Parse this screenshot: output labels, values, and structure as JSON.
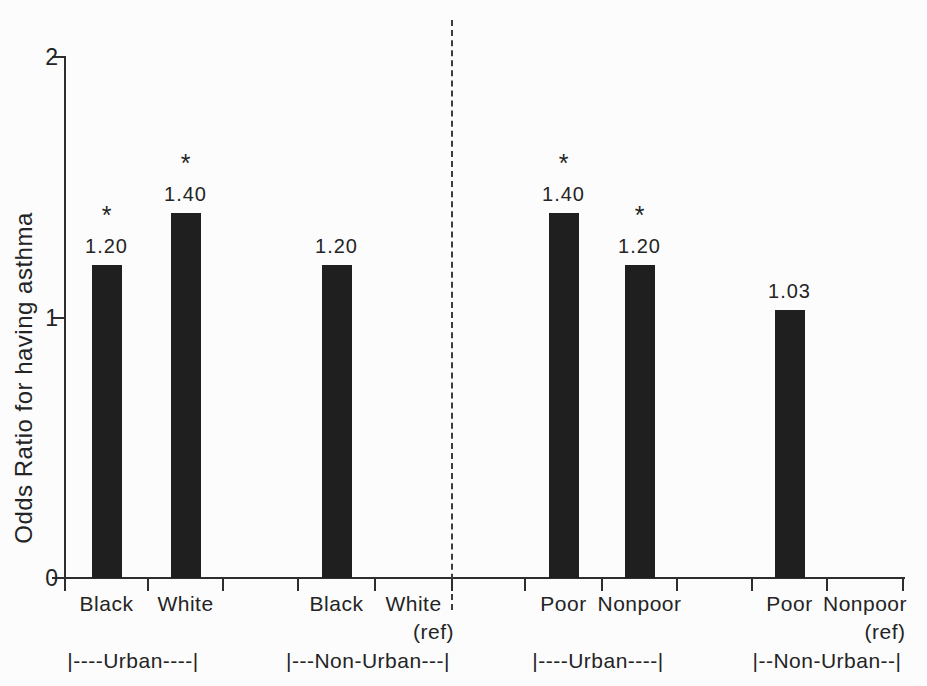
{
  "figure": {
    "colors": {
      "background": "#fcfcfc",
      "bar": "#1f1f1f",
      "axis": "#2e2e2e",
      "text": "#242424",
      "divider": "#3c3c3c"
    }
  },
  "chart_data": {
    "type": "bar",
    "title": "",
    "xlabel": "",
    "ylabel": "Odds Ratio for having asthma",
    "ylim": [
      0,
      2
    ],
    "grid": false,
    "legend": null,
    "y_ticks": [
      {
        "value": 2,
        "label": "2"
      },
      {
        "value": 1,
        "label": "1"
      },
      {
        "value": 0,
        "label": "0"
      }
    ],
    "significance_marker": "*",
    "bars": [
      {
        "label": "Black",
        "sublabel": "",
        "value": 1.2,
        "value_label": "1.20",
        "significant": true,
        "reference": false
      },
      {
        "label": "White",
        "sublabel": "",
        "value": 1.4,
        "value_label": "1.40",
        "significant": true,
        "reference": false
      },
      {
        "label": "Black",
        "sublabel": "",
        "value": 1.2,
        "value_label": "1.20",
        "significant": false,
        "reference": false
      },
      {
        "label": "White",
        "sublabel": "(ref)",
        "value": null,
        "value_label": "",
        "significant": false,
        "reference": true
      },
      {
        "label": "Poor",
        "sublabel": "",
        "value": 1.4,
        "value_label": "1.40",
        "significant": true,
        "reference": false
      },
      {
        "label": "Nonpoor",
        "sublabel": "",
        "value": 1.2,
        "value_label": "1.20",
        "significant": true,
        "reference": false
      },
      {
        "label": "Poor",
        "sublabel": "",
        "value": 1.03,
        "value_label": "1.03",
        "significant": false,
        "reference": false
      },
      {
        "label": "Nonpoor",
        "sublabel": "(ref)",
        "value": null,
        "value_label": "",
        "significant": false,
        "reference": true
      }
    ],
    "group_labels": [
      "|----Urban----|",
      "|---Non-Urban---|",
      "|----Urban----|",
      "|--Non-Urban--|"
    ]
  }
}
